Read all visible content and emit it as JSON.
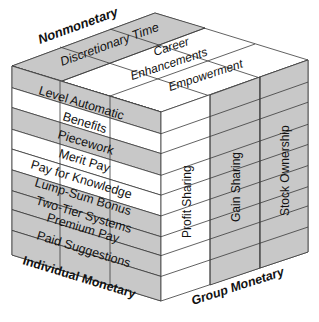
{
  "axes": {
    "top": "Nonmonetary",
    "bottom_left": "Individual Monetary",
    "bottom_right": "Group Monetary"
  },
  "top_face": {
    "items": [
      "Discretionary Time",
      "Career",
      "Enhancements",
      "Empowerment"
    ]
  },
  "left_face": {
    "rows": [
      {
        "label": "Level Automatic",
        "shade": "gray"
      },
      {
        "label": "Benefits",
        "shade": "white"
      },
      {
        "label": "Piecework",
        "shade": "gray"
      },
      {
        "label": "Merit Pay",
        "shade": "white"
      },
      {
        "label": "Pay for Knowledge",
        "shade": "white"
      },
      {
        "label": "Lump-Sum Bonus",
        "shade": "gray"
      },
      {
        "label": "Two-Tier Systems",
        "shade": "gray"
      },
      {
        "label": "Premium Pay",
        "shade": "gray"
      },
      {
        "label": "Paid Suggestions",
        "shade": "gray"
      }
    ]
  },
  "right_face": {
    "columns": [
      {
        "label": "Profit Sharing",
        "shade": "white"
      },
      {
        "label": "Gain Sharing",
        "shade": "gray"
      },
      {
        "label": "Stock Ownership",
        "shade": "gray"
      }
    ]
  },
  "colors": {
    "gray": "#c8c8c8",
    "white": "#ffffff",
    "line": "#3a3a3a"
  }
}
